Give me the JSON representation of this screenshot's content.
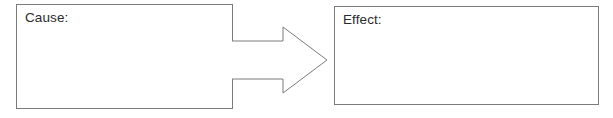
{
  "diagram": {
    "type": "cause-and-effect-graphic-organizer",
    "background_color": "#ffffff",
    "stroke_color": "#7b7b7b",
    "text_color": "#2b2b2b",
    "boxes": [
      {
        "id": "cause",
        "label": "Cause:",
        "value": ""
      },
      {
        "id": "effect",
        "label": "Effect:",
        "value": ""
      }
    ],
    "connector": {
      "id": "arrow",
      "icon": "right-arrow-icon",
      "direction": "right",
      "from": "cause",
      "to": "effect"
    }
  }
}
